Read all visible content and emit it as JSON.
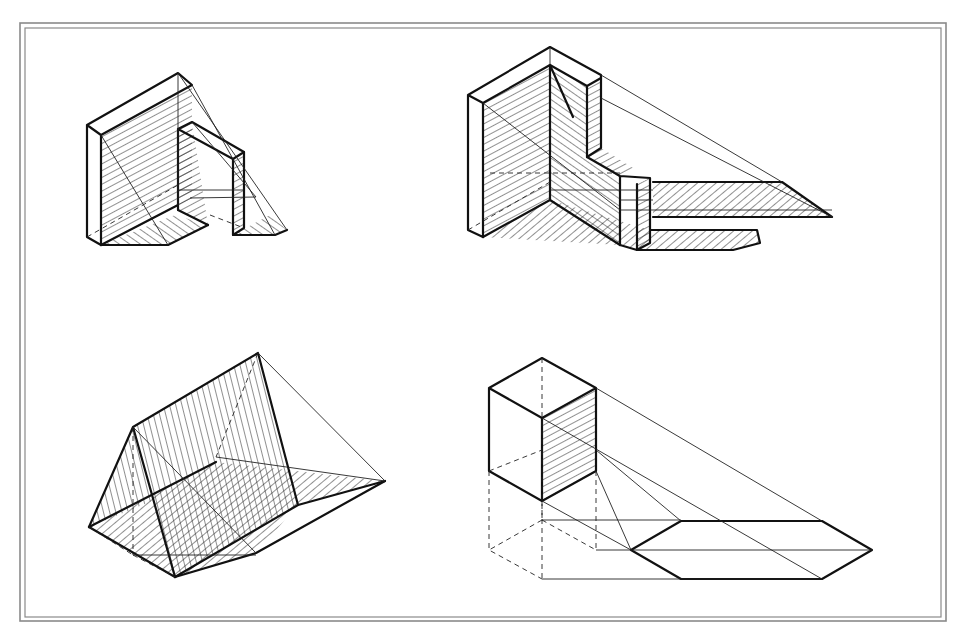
{
  "sheet": {
    "width": 963,
    "height": 644,
    "background": "#ffffff",
    "ink_color": "#111111",
    "border_color": "#8a8a8a",
    "border_outer": [
      20,
      23,
      946,
      621
    ],
    "border_inner": [
      25,
      28,
      941,
      617
    ]
  },
  "figures": [
    {
      "id": "wall-with-frame",
      "description": "Wall slab with an attached rectangular frame casting shadows on ground plane",
      "position": "top-left"
    },
    {
      "id": "l-shaped-wall",
      "description": "L-shaped wall with a post; long cast shadow to the right",
      "position": "top-right"
    },
    {
      "id": "triangular-prism",
      "description": "Triangular prism (tent) with shaded faces and ground shadow",
      "position": "bottom-left"
    },
    {
      "id": "cube",
      "description": "Raised cube with projection lines and hexagonal cast shadow",
      "position": "bottom-right"
    }
  ]
}
